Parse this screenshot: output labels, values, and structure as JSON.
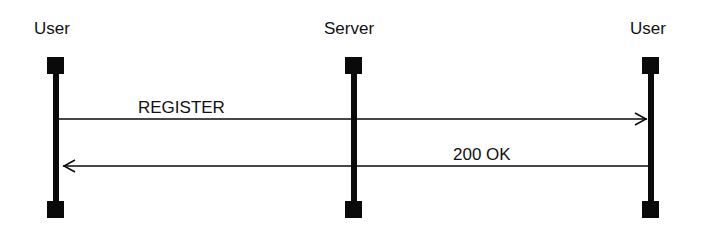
{
  "diagram": {
    "type": "sequence",
    "participants": [
      {
        "id": "user_left",
        "label": "User"
      },
      {
        "id": "server",
        "label": "Server"
      },
      {
        "id": "user_right",
        "label": "User"
      }
    ],
    "messages": [
      {
        "from": "user_left",
        "to": "user_right",
        "label": "REGISTER"
      },
      {
        "from": "user_right",
        "to": "user_left",
        "label": "200 OK"
      }
    ],
    "colors": {
      "line": "#0a0a0a",
      "background": "#ffffff"
    }
  }
}
